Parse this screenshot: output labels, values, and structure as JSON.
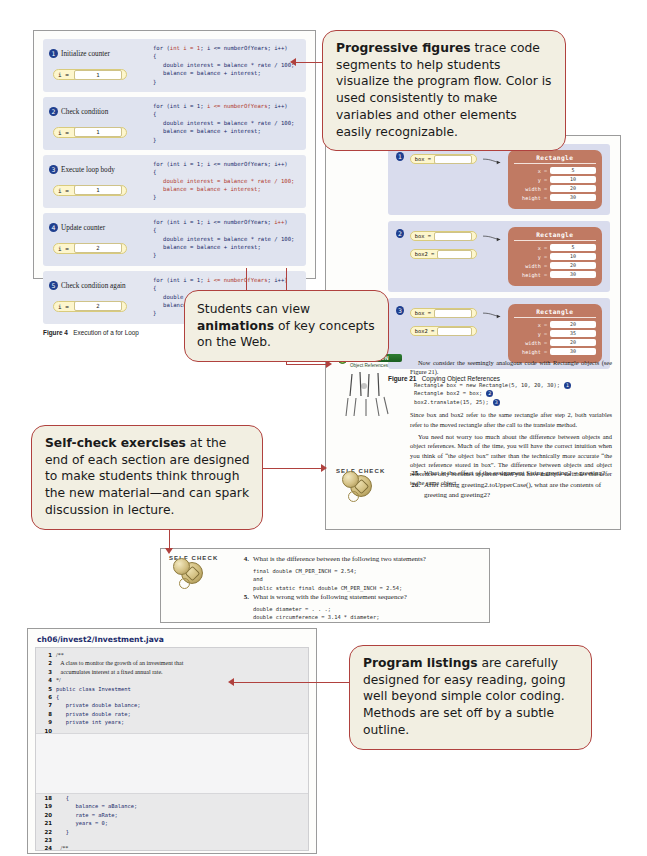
{
  "callouts": [
    {
      "id": "progressive-figures",
      "lead": "Progressive figures",
      "rest": " trace code segments to help students visualize the program flow. Color is used consistently to make variables and other elements easily recognizable."
    },
    {
      "id": "animations",
      "lead_pre": "Students can view ",
      "lead": "animations",
      "rest": " of key concepts on the Web."
    },
    {
      "id": "self-check-exercises",
      "lead": "Self-check exercises",
      "rest": " at the end of each section are designed to make students think through the new material—and can spark discussion in lecture."
    },
    {
      "id": "program-listings",
      "lead": "Program listings",
      "rest": " are carefully designed for easy reading, going well beyond simple color coding. Methods are set off by a subtle outline."
    }
  ],
  "figure4": {
    "caption_num": "Figure 4",
    "caption_text": "Execution of a for Loop",
    "steps": [
      {
        "n": "1",
        "label": "Initialize counter",
        "var_name": "i =",
        "var_value": "1",
        "code_head": "for (int i = 1; i <= numberOfYears; i++)",
        "code_head_hl": "int i = 1",
        "code_body": "{\n   double interest = balance * rate / 100;\n   balance = balance + interest;\n}",
        "highlight": "init"
      },
      {
        "n": "2",
        "label": "Check condition",
        "var_name": "i =",
        "var_value": "1",
        "code_head": "for (int i = 1; i <= numberOfYears; i++)",
        "code_head_hl": "i <= numberOfYears",
        "code_body": "{\n   double interest = balance * rate / 100;\n   balance = balance + interest;\n}",
        "highlight": "cond"
      },
      {
        "n": "3",
        "label": "Execute loop body",
        "var_name": "i =",
        "var_value": "1",
        "code_head": "for (int i = 1; i <= numberOfYears; i++)",
        "code_head_hl": "",
        "code_body": "{\n   double interest = balance * rate / 100;\n   balance = balance + interest;\n}",
        "highlight": "body"
      },
      {
        "n": "4",
        "label": "Update counter",
        "var_name": "i =",
        "var_value": "2",
        "code_head": "for (int i = 1; i <= numberOfYears; i++)",
        "code_head_hl": "i++",
        "code_body": "{\n   double interest = balance * rate / 100;\n   balance = balance + interest;\n}",
        "highlight": "update"
      },
      {
        "n": "5",
        "label": "Check condition again",
        "var_name": "i =",
        "var_value": "2",
        "code_head": "for (int i = 1; i <= numberOfYears; i++)",
        "code_head_hl": "i <= numberOfYears",
        "code_body": "{\n   double interest = balance * rate / 100;\n   balance = balance + interest;\n}",
        "highlight": "cond"
      }
    ]
  },
  "figure21": {
    "caption_num": "Figure 21",
    "caption_text": "Copying Object References",
    "class_name": "Rectangle",
    "steps": [
      {
        "n": "1",
        "refs": [
          {
            "name": "box ="
          }
        ],
        "fields": [
          {
            "name": "x =",
            "value": "5"
          },
          {
            "name": "y =",
            "value": "10"
          },
          {
            "name": "width =",
            "value": "20"
          },
          {
            "name": "height =",
            "value": "30"
          }
        ]
      },
      {
        "n": "2",
        "refs": [
          {
            "name": "box ="
          },
          {
            "name": "box2 ="
          }
        ],
        "fields": [
          {
            "name": "x =",
            "value": "5"
          },
          {
            "name": "y =",
            "value": "10"
          },
          {
            "name": "width =",
            "value": "20"
          },
          {
            "name": "height =",
            "value": "30"
          }
        ]
      },
      {
        "n": "3",
        "refs": [
          {
            "name": "box ="
          },
          {
            "name": "box2 ="
          }
        ],
        "fields": [
          {
            "name": "x =",
            "value": "20"
          },
          {
            "name": "y =",
            "value": "35"
          },
          {
            "name": "width =",
            "value": "20"
          },
          {
            "name": "height =",
            "value": "30"
          }
        ]
      }
    ]
  },
  "right_page": {
    "para1": "Now consider the seemingly analogous code with Rectangle objects (see Figure 21).",
    "code": [
      {
        "text": "Rectangle box = new Rectangle(5, 10, 20, 30);",
        "dot": "1"
      },
      {
        "text": "Rectangle box2 = box;",
        "dot": "2"
      },
      {
        "text": "box2.translate(15, 25);",
        "dot": "3"
      }
    ],
    "para2": "Since box and box2 refer to the same rectangle after step 2, both variables refer to the moved rectangle after the call to the translate method.",
    "para3": "You need not worry too much about the difference between objects and object references. Much of the time, you will have the correct intuition when you think of “the object box” rather than the technically more accurate “the object reference stored in box”. The difference between objects and object references only becomes apparent when you have multiple variables that refer to the same object.",
    "self_check_label": "SELF CHECK",
    "questions": [
      {
        "num": "25.",
        "text": "What is the effect of the assignment String greeting2 = greeting?"
      },
      {
        "num": "26.",
        "text": "After calling greeting2.toUpperCase(), what are the contents of greeting and greeting2?"
      }
    ]
  },
  "animation_icon": {
    "badge": "ANIMATION",
    "sub": "Object References"
  },
  "self_check_panel": {
    "label": "SELF CHECK",
    "questions": [
      {
        "num": "4.",
        "text": "What is the difference between the following two statements?",
        "code": [
          "final double CM_PER_INCH = 2.54;",
          "and",
          "public static final double CM_PER_INCH = 2.54;"
        ]
      },
      {
        "num": "5.",
        "text": "What is wrong with the following statement sequence?",
        "code": [
          "double diameter = . . .;",
          "double circumference = 3.14 * diameter;"
        ]
      }
    ]
  },
  "listing": {
    "title": "ch06/invest2/Investment.java",
    "lines": [
      {
        "n": "1",
        "code": "/**",
        "kind": "comment"
      },
      {
        "n": "2",
        "code": "   A class to monitor the growth of an investment that",
        "kind": "comment"
      },
      {
        "n": "3",
        "code": "   accumulates interest at a fixed annual rate.",
        "kind": "comment"
      },
      {
        "n": "4",
        "code": "*/",
        "kind": "comment"
      },
      {
        "n": "5",
        "code": "public class Investment",
        "kind": "code"
      },
      {
        "n": "6",
        "code": "{",
        "kind": "code"
      },
      {
        "n": "7",
        "code": "   private double balance;",
        "kind": "code"
      },
      {
        "n": "8",
        "code": "   private double rate;",
        "kind": "code"
      },
      {
        "n": "9",
        "code": "   private int years;",
        "kind": "code"
      },
      {
        "n": "10",
        "code": "",
        "kind": "code"
      },
      {
        "n": "11",
        "code": "   /**",
        "kind": "comment"
      },
      {
        "n": "12",
        "code": "      Constructs an Investment object from a starting balance and",
        "kind": "comment"
      },
      {
        "n": "13",
        "code": "      interest rate.",
        "kind": "comment"
      },
      {
        "n": "14",
        "code": "      @param aBalance  the starting balance",
        "kind": "comment"
      },
      {
        "n": "15",
        "code": "      @param aRate  the interest rate in percent",
        "kind": "comment"
      },
      {
        "n": "16",
        "code": "   */",
        "kind": "comment"
      },
      {
        "n": "17",
        "code": "   public Investment(double aBalance, double aRate)",
        "kind": "code"
      },
      {
        "n": "18",
        "code": "   {",
        "kind": "code"
      },
      {
        "n": "19",
        "code": "      balance = aBalance;",
        "kind": "code"
      },
      {
        "n": "20",
        "code": "      rate = aRate;",
        "kind": "code"
      },
      {
        "n": "21",
        "code": "      years = 0;",
        "kind": "code"
      },
      {
        "n": "22",
        "code": "   }",
        "kind": "code"
      },
      {
        "n": "23",
        "code": "",
        "kind": "code"
      },
      {
        "n": "24",
        "code": "   /**",
        "kind": "comment"
      },
      {
        "n": "25",
        "code": "      Keeps accumulating interest until a target balance has",
        "kind": "comment"
      },
      {
        "n": "26",
        "code": "      been reached.",
        "kind": "comment"
      },
      {
        "n": "27",
        "code": "      @param targetBalance  the desired balance",
        "kind": "comment"
      }
    ]
  },
  "colors": {
    "callout_border": "#b0413e",
    "callout_fill": "#f2efe2",
    "trace_bg": "#e3e6f0",
    "object_fill": "#c07a63",
    "var_fill": "#fdf6cd",
    "listing_bg": "#e9e9ea",
    "title_blue": "#1b2b6b"
  }
}
